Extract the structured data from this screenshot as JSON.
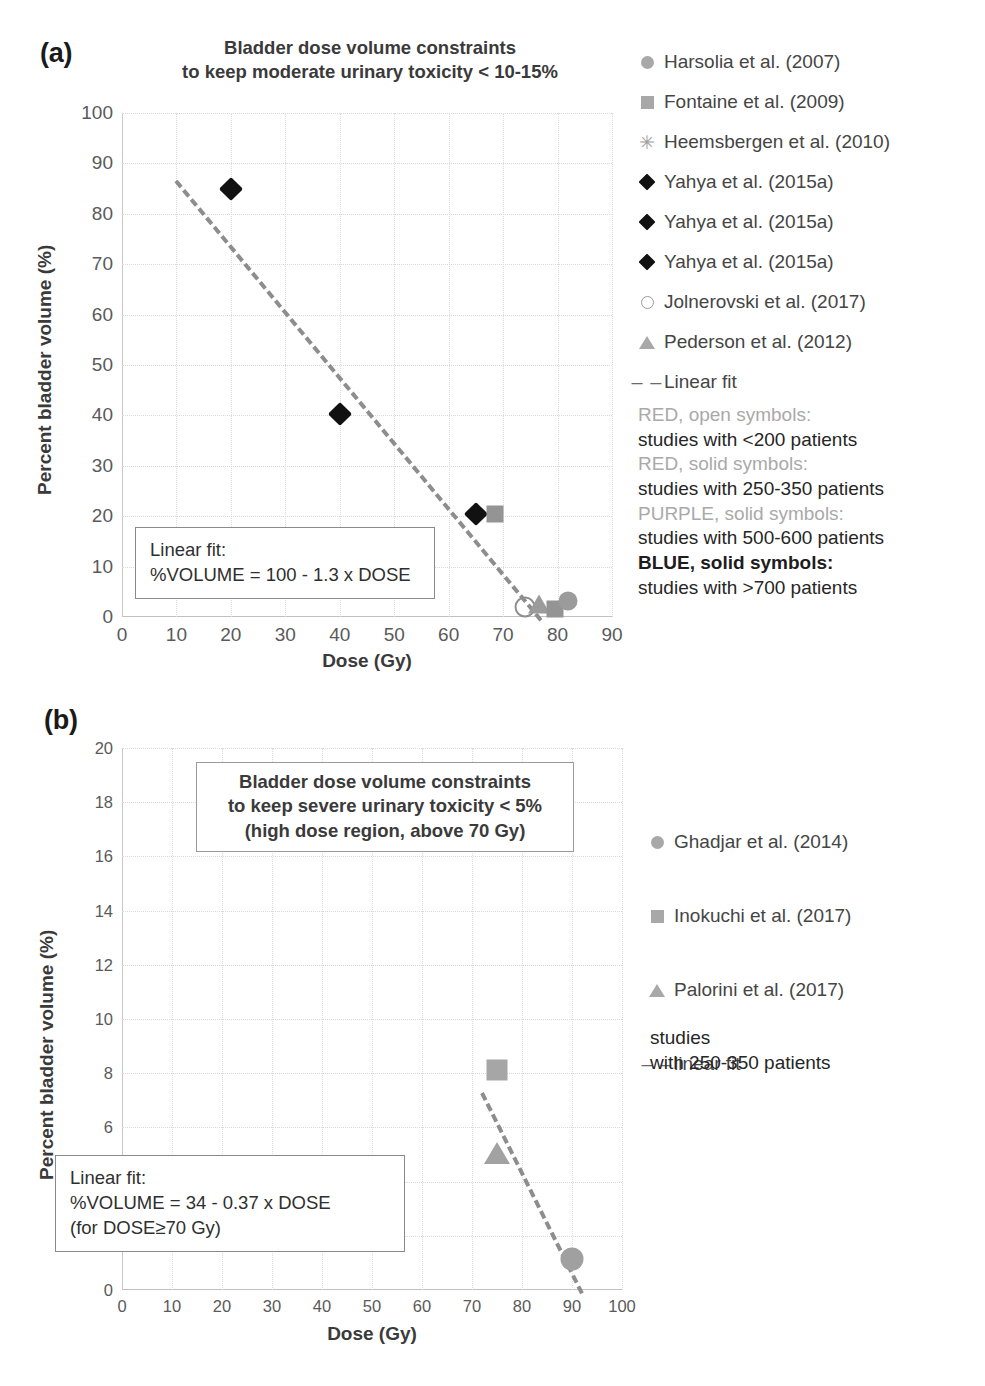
{
  "figure": {
    "panel_a_label": "(a)",
    "panel_b_label": "(b)"
  },
  "panel_a": {
    "title_line1": "Bladder dose volume constraints",
    "title_line2": "to keep moderate urinary toxicity < 10-15%",
    "xlabel": "Dose (Gy)",
    "ylabel": "Percent bladder volume (%)",
    "xticks": [
      "0",
      "10",
      "20",
      "30",
      "40",
      "50",
      "60",
      "70",
      "80",
      "90"
    ],
    "yticks": [
      "0",
      "10",
      "20",
      "30",
      "40",
      "50",
      "60",
      "70",
      "80",
      "90",
      "100"
    ],
    "annotation": {
      "line1": "Linear fit:",
      "line2": "%VOLUME = 100 - 1.3 x DOSE"
    },
    "legend": [
      {
        "symbol": "circle-solid-grey",
        "label": "Harsolia et al. (2007)"
      },
      {
        "symbol": "square-solid-grey",
        "label": "Fontaine et al. (2009)"
      },
      {
        "symbol": "asterisk-grey",
        "label": "Heemsbergen et al. (2010)"
      },
      {
        "symbol": "diamond-solid-black",
        "label": "Yahya et al. (2015a)"
      },
      {
        "symbol": "diamond-solid-black",
        "label": "Yahya et al. (2015a)"
      },
      {
        "symbol": "diamond-solid-black",
        "label": "Yahya et al. (2015a)"
      },
      {
        "symbol": "circle-open-grey",
        "label": "Jolnerovski et al. (2017)"
      },
      {
        "symbol": "triangle-solid-grey",
        "label": "Pederson et al. (2012)"
      },
      {
        "symbol": "dashed-line",
        "label": "Linear fit"
      }
    ],
    "notes": [
      {
        "head": "RED, open symbols:",
        "body": "studies with <200 patients",
        "bold": false
      },
      {
        "head": "RED, solid symbols:",
        "body": "studies with 250-350 patients",
        "bold": false
      },
      {
        "head": "PURPLE, solid symbols:",
        "body": "studies with 500-600 patients",
        "bold": false
      },
      {
        "head": "BLUE, solid symbols:",
        "body": "studies with >700 patients",
        "bold": true
      }
    ]
  },
  "panel_b": {
    "title_line1": "Bladder dose volume constraints",
    "title_line2": "to keep severe urinary toxicity < 5%",
    "title_line3": "(high dose region, above 70 Gy)",
    "xlabel": "Dose (Gy)",
    "ylabel": "Percent bladder volume (%)",
    "xticks": [
      "0",
      "10",
      "20",
      "30",
      "40",
      "50",
      "60",
      "70",
      "80",
      "90",
      "100"
    ],
    "yticks": [
      "0",
      "2",
      "4",
      "6",
      "8",
      "10",
      "12",
      "14",
      "16",
      "18",
      "20"
    ],
    "annotation": {
      "line1": "Linear fit:",
      "line2": "%VOLUME = 34 - 0.37 x DOSE",
      "line3": "(for DOSE≥70 Gy)"
    },
    "legend": [
      {
        "symbol": "circle-solid-grey",
        "label": "Ghadjar et al. (2014)"
      },
      {
        "symbol": "square-solid-grey",
        "label": "Inokuchi et al. (2017)"
      },
      {
        "symbol": "triangle-solid-grey",
        "label": "Palorini et al. (2017)"
      },
      {
        "symbol": "dashed-line",
        "label": "linear fit"
      }
    ],
    "notes": [
      {
        "line": "studies"
      },
      {
        "line": "with 250-350 patients"
      }
    ]
  },
  "chart_data": [
    {
      "type": "scatter",
      "id": "panel-a",
      "title": "Bladder dose volume constraints to keep moderate urinary toxicity < 10-15%",
      "xlabel": "Dose (Gy)",
      "ylabel": "Percent bladder volume (%)",
      "xlim": [
        0,
        90
      ],
      "ylim": [
        0,
        100
      ],
      "xtick_step": 10,
      "ytick_step": 10,
      "grid": true,
      "legend_position": "right",
      "points": [
        {
          "series": "Yahya et al. (2015a)",
          "marker": "diamond-solid-black",
          "x": 20,
          "y": 85
        },
        {
          "series": "Yahya et al. (2015a)",
          "marker": "diamond-solid-black",
          "x": 40,
          "y": 40.3
        },
        {
          "series": "Yahya et al. (2015a)",
          "marker": "diamond-solid-black",
          "x": 65,
          "y": 20.5
        },
        {
          "series": "Fontaine et al. (2009)",
          "marker": "square-solid-grey",
          "x": 68.5,
          "y": 20.5
        },
        {
          "series": "Jolnerovski et al. (2017)",
          "marker": "circle-open-grey",
          "x": 74,
          "y": 2.0
        },
        {
          "series": "Pederson et al. (2012)",
          "marker": "triangle-solid-grey",
          "x": 76.5,
          "y": 2.5
        },
        {
          "series": "Heemsbergen et al. (2010)",
          "marker": "square-solid-grey",
          "x": 79.5,
          "y": 1.5
        },
        {
          "series": "Harsolia et al. (2007)",
          "marker": "circle-solid-grey",
          "x": 82,
          "y": 3.2
        }
      ],
      "fit": {
        "label": "Linear fit",
        "equation": "%VOLUME = 100 - 1.3 x DOSE",
        "slope": -1.3,
        "intercept": 100,
        "style": "dashed",
        "x_start": 10,
        "x_end": 77
      }
    },
    {
      "type": "scatter",
      "id": "panel-b",
      "title": "Bladder dose volume constraints to keep severe urinary toxicity < 5% (high dose region, above 70 Gy)",
      "xlabel": "Dose (Gy)",
      "ylabel": "Percent bladder volume (%)",
      "xlim": [
        0,
        100
      ],
      "ylim": [
        0,
        20
      ],
      "xtick_step": 10,
      "ytick_step": 2,
      "grid": true,
      "legend_position": "right",
      "points": [
        {
          "series": "Inokuchi et al. (2017)",
          "marker": "square-solid-grey",
          "x": 75,
          "y": 8.1
        },
        {
          "series": "Palorini et al. (2017)",
          "marker": "triangle-solid-grey",
          "x": 75,
          "y": 5.05
        },
        {
          "series": "Ghadjar et al. (2014)",
          "marker": "circle-solid-grey",
          "x": 90,
          "y": 1.15
        }
      ],
      "fit": {
        "label": "linear fit",
        "equation": "%VOLUME = 34 - 0.37 x DOSE",
        "slope": -0.37,
        "intercept": 34,
        "style": "dashed",
        "x_start": 72,
        "x_end": 92
      }
    }
  ]
}
